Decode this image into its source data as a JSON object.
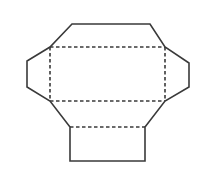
{
  "diagram": {
    "width": 200,
    "height": 170,
    "stroke_color": "#3a3a3a",
    "background": "#ffffff",
    "outline_points": "72,24 150,24 165,47 189,63 189,87 165,101 145,127 145,161 70,161 70,127 50,101 27,87 27,61 50,47",
    "fold_lines": [
      {
        "name": "fold-top",
        "x1": 50,
        "y1": 47,
        "x2": 165,
        "y2": 47
      },
      {
        "name": "fold-left",
        "x1": 50,
        "y1": 47,
        "x2": 50,
        "y2": 101
      },
      {
        "name": "fold-right",
        "x1": 165,
        "y1": 47,
        "x2": 165,
        "y2": 101
      },
      {
        "name": "fold-middle",
        "x1": 50,
        "y1": 101,
        "x2": 165,
        "y2": 101
      },
      {
        "name": "fold-bottom",
        "x1": 70,
        "y1": 127,
        "x2": 145,
        "y2": 127
      }
    ],
    "panels": [
      "top-flap",
      "left-tab",
      "right-tab",
      "center-panel",
      "lower-flap",
      "bottom-panel"
    ]
  }
}
